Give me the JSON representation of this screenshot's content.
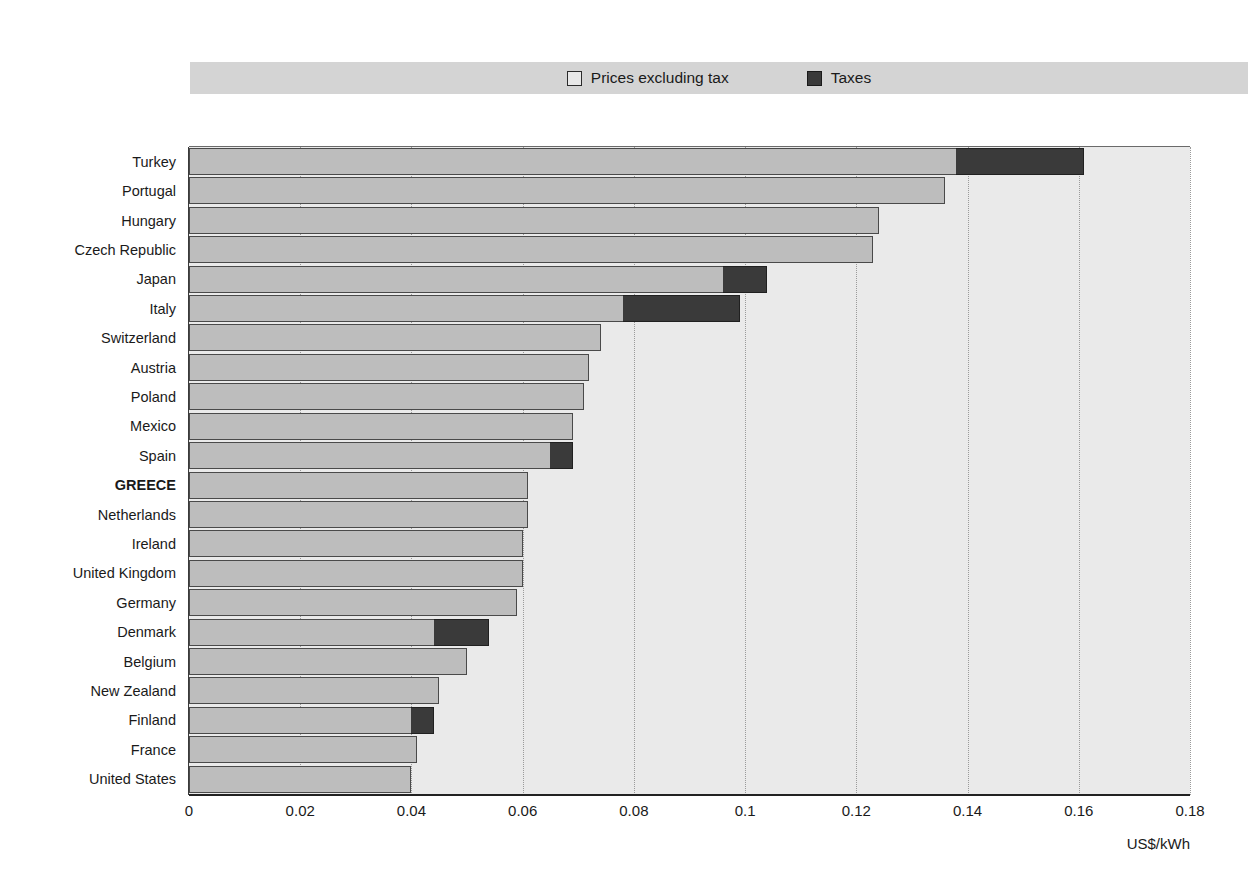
{
  "legend": {
    "position": "top",
    "entries": [
      {
        "label": "Prices excluding tax",
        "swatch": "light-gray-square-icon",
        "color": "#bdbdbd"
      },
      {
        "label": "Taxes",
        "swatch": "dark-gray-square-icon",
        "color": "#3a3a3a"
      }
    ]
  },
  "axis": {
    "unit": "US$/kWh",
    "ticks": [
      "0",
      "0.02",
      "0.04",
      "0.06",
      "0.08",
      "0.1",
      "0.12",
      "0.14",
      "0.16",
      "0.18"
    ],
    "tick_values": [
      0,
      0.02,
      0.04,
      0.06,
      0.08,
      0.1,
      0.12,
      0.14,
      0.16,
      0.18
    ]
  },
  "highlight_country": "GREECE",
  "chart_data": {
    "type": "bar",
    "orientation": "horizontal",
    "stacked": true,
    "title": "",
    "xlabel": "US$/kWh",
    "ylabel": "",
    "xlim": [
      0,
      0.18
    ],
    "grid": "vertical-dotted",
    "legend_position": "top",
    "categories": [
      "Turkey",
      "Portugal",
      "Hungary",
      "Czech Republic",
      "Japan",
      "Italy",
      "Switzerland",
      "Austria",
      "Poland",
      "Mexico",
      "Spain",
      "GREECE",
      "Netherlands",
      "Ireland",
      "United Kingdom",
      "Germany",
      "Denmark",
      "Belgium",
      "New Zealand",
      "Finland",
      "France",
      "United States"
    ],
    "series": [
      {
        "name": "Prices excluding tax",
        "values": [
          0.138,
          0.136,
          0.124,
          0.123,
          0.096,
          0.078,
          0.074,
          0.072,
          0.071,
          0.069,
          0.065,
          0.061,
          0.061,
          0.06,
          0.06,
          0.059,
          0.044,
          0.05,
          0.045,
          0.04,
          0.041,
          0.04
        ]
      },
      {
        "name": "Taxes",
        "values": [
          0.023,
          0.0,
          0.0,
          0.0,
          0.008,
          0.021,
          0.0,
          0.0,
          0.0,
          0.0,
          0.004,
          0.0,
          0.0,
          0.0,
          0.0,
          0.0,
          0.01,
          0.0,
          0.0,
          0.004,
          0.0,
          0.0
        ]
      }
    ],
    "totals": [
      0.161,
      0.136,
      0.124,
      0.123,
      0.104,
      0.099,
      0.074,
      0.072,
      0.071,
      0.069,
      0.069,
      0.061,
      0.061,
      0.06,
      0.06,
      0.059,
      0.054,
      0.05,
      0.045,
      0.044,
      0.041,
      0.04
    ]
  }
}
